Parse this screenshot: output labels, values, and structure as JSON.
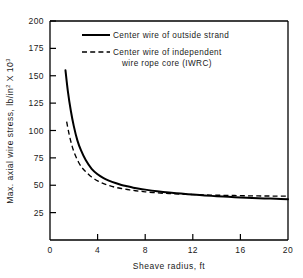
{
  "chart_data": {
    "type": "line",
    "title": "",
    "xlabel": "Sheave radius, ft",
    "ylabel_parts": {
      "main": "Max. axial wire stress, lb/in",
      "sup1": "2",
      "mid": " X 10",
      "sup2": "3"
    },
    "ylabel": "Max. axial wire stress, lb/in2 X 103",
    "xlim": [
      0,
      20
    ],
    "ylim": [
      0,
      200
    ],
    "xticks": [
      0,
      4,
      8,
      12,
      16,
      20
    ],
    "xtick_labels": [
      "0",
      "4",
      "8",
      "12",
      "16",
      "20"
    ],
    "yticks": [
      25,
      50,
      75,
      100,
      125,
      150,
      175,
      200
    ],
    "ytick_labels": [
      "25",
      "50",
      "75",
      "100",
      "125",
      "150",
      "175",
      "200"
    ],
    "grid": false,
    "legend_position": "upper-right-inside",
    "series": [
      {
        "name": "Center wire of outside strand",
        "style": "solid",
        "color": "#000000",
        "x": [
          1.3,
          1.5,
          1.75,
          2.0,
          2.3,
          2.6,
          3.0,
          3.5,
          4.0,
          4.5,
          5.0,
          5.5,
          6.0,
          6.5,
          7.0,
          7.5,
          8.0,
          9.0,
          10.0,
          11.0,
          12.0,
          13.0,
          14.0,
          15.0,
          16.0,
          17.0,
          18.0,
          19.0,
          20.0
        ],
        "y": [
          155.0,
          136.0,
          118.0,
          104.0,
          91.0,
          82.0,
          73.0,
          65.0,
          60.0,
          56.5,
          54.0,
          52.0,
          50.3,
          49.0,
          47.8,
          46.8,
          46.0,
          44.6,
          43.4,
          42.4,
          41.5,
          40.7,
          40.0,
          39.4,
          38.9,
          38.4,
          38.0,
          37.6,
          37.2
        ]
      },
      {
        "name": "Center wire of independent wire rope core (IWRC)",
        "style": "dashed",
        "color": "#000000",
        "x": [
          1.4,
          1.6,
          1.85,
          2.1,
          2.4,
          2.7,
          3.0,
          3.5,
          4.0,
          4.5,
          5.0,
          5.5,
          6.0,
          6.5,
          7.0,
          7.5,
          8.0,
          9.0,
          10.0,
          11.0,
          12.0,
          13.0,
          14.0,
          15.0,
          16.0,
          17.0,
          18.0,
          19.0,
          20.0
        ],
        "y": [
          108.0,
          97.0,
          86.0,
          78.0,
          71.0,
          66.0,
          62.5,
          57.5,
          54.0,
          51.5,
          49.6,
          48.1,
          47.0,
          46.1,
          45.3,
          44.6,
          44.0,
          43.1,
          42.4,
          41.9,
          41.5,
          41.2,
          40.9,
          40.7,
          40.5,
          40.3,
          40.2,
          40.1,
          40.0
        ]
      }
    ],
    "legend": [
      {
        "label_line1": "Center wire of outside strand",
        "label_line2": "",
        "style": "solid"
      },
      {
        "label_line1": "Center wire of independent",
        "label_line2": "wire rope core (IWRC)",
        "style": "dashed"
      }
    ]
  }
}
